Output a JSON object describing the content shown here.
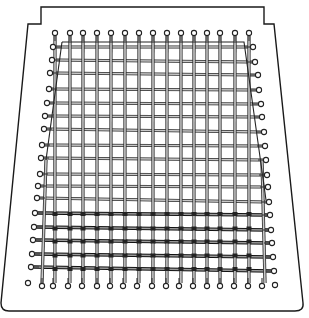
{
  "figure": {
    "colors": {
      "background": "#ffffff",
      "outline": "#1a1a1a",
      "thread_edge": "#2a2a2a",
      "thread_core": "#c8c8c8",
      "pin_fill": "#ffffff"
    },
    "board_outline": {
      "top_y": 7,
      "notch_left_x": 41,
      "notch_right_x": 264,
      "notch_bottom_y": 24,
      "shoulder_left_x": 28,
      "shoulder_right_x": 274,
      "bottom_left_x": 1,
      "bottom_right_x": 303,
      "bottom_y": 311,
      "corner_radius": 8
    },
    "pins": {
      "top": [
        [
          55,
          33
        ],
        [
          70,
          33
        ],
        [
          83,
          33
        ],
        [
          97,
          33
        ],
        [
          111,
          33
        ],
        [
          125,
          33
        ],
        [
          139,
          33
        ],
        [
          153,
          33
        ],
        [
          167,
          33
        ],
        [
          181,
          33
        ],
        [
          194,
          33
        ],
        [
          207,
          33
        ],
        [
          220,
          33
        ],
        [
          235,
          33
        ],
        [
          249,
          33
        ]
      ],
      "bottom": [
        [
          42,
          286
        ],
        [
          53,
          286
        ],
        [
          68,
          286
        ],
        [
          82,
          286
        ],
        [
          97,
          286
        ],
        [
          110,
          286
        ],
        [
          123,
          286
        ],
        [
          137,
          286
        ],
        [
          152,
          286
        ],
        [
          166,
          286
        ],
        [
          179,
          286
        ],
        [
          193,
          286
        ],
        [
          207,
          286
        ],
        [
          220,
          286
        ],
        [
          234,
          286
        ],
        [
          248,
          286
        ],
        [
          262,
          286
        ]
      ],
      "left": [
        [
          53,
          47
        ],
        [
          52,
          60
        ],
        [
          50,
          73
        ],
        [
          49,
          89
        ],
        [
          47,
          103
        ],
        [
          45,
          116
        ],
        [
          44,
          129
        ],
        [
          42,
          145
        ],
        [
          41,
          158
        ],
        [
          40,
          174
        ],
        [
          38,
          186
        ],
        [
          37,
          198
        ],
        [
          35,
          213
        ],
        [
          34,
          227
        ],
        [
          33,
          240
        ],
        [
          32,
          254
        ],
        [
          31,
          267
        ]
      ],
      "right": [
        [
          253,
          47
        ],
        [
          255,
          62
        ],
        [
          258,
          75
        ],
        [
          259,
          90
        ],
        [
          261,
          104
        ],
        [
          262,
          117
        ],
        [
          264,
          132
        ],
        [
          265,
          146
        ],
        [
          266,
          160
        ],
        [
          267,
          175
        ],
        [
          268,
          187
        ],
        [
          269,
          202
        ],
        [
          270,
          215
        ],
        [
          271,
          230
        ],
        [
          272,
          243
        ],
        [
          273,
          257
        ],
        [
          274,
          271
        ]
      ],
      "stray": [
        [
          28,
          283
        ],
        [
          275,
          285
        ]
      ]
    },
    "warp_threads_count": 15,
    "weft_threads_count": 17,
    "dense_woven_rows_from": 12,
    "inner_frame": [
      [
        62,
        42
      ],
      [
        244,
        42
      ],
      [
        266,
        200
      ]
    ]
  }
}
